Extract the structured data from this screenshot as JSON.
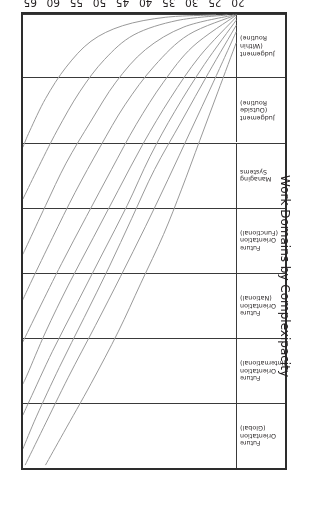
{
  "figure": {
    "orientation_note": "page-rotated-180",
    "frame_color": "#2d2d2d",
    "curve_color": "#9a9a9a",
    "background": "#ffffff"
  },
  "axes": {
    "x": {
      "title": "Age",
      "ticks": [
        20,
        25,
        30,
        35,
        40,
        45,
        50,
        55,
        60,
        65
      ],
      "min": 20,
      "max": 67
    },
    "y": {
      "title": "Work Domains by Complexipacity"
    }
  },
  "chart_data": {
    "type": "line",
    "title": "",
    "xlabel": "Age",
    "ylabel": "Work Domains by Complexipacity",
    "xlim": [
      20,
      67
    ],
    "grid": false,
    "legend": "none",
    "categories": [
      "Future\nOrientation\n(Global)",
      "Future\nOrientation\n(International)",
      "Future\nOrientation\n(National)",
      "Future\nOrientation\n(Functional)",
      "Managing\nSystems",
      "Judgement\n(Outside\nRoutine)",
      "Judgement\n(Within\nRoutine)"
    ],
    "band_boundaries_age_index": [
      0,
      1,
      2,
      3,
      4,
      5,
      6,
      7
    ],
    "series": [
      {
        "name": "track-1",
        "points": [
          [
            20.0,
            6.55
          ],
          [
            24.0,
            5.8
          ],
          [
            28.0,
            5.05
          ],
          [
            32.0,
            4.3
          ],
          [
            36.0,
            3.6
          ],
          [
            41.0,
            2.85
          ],
          [
            46.0,
            2.1
          ],
          [
            52.0,
            1.3
          ],
          [
            58.0,
            0.55
          ],
          [
            62.0,
            0.05
          ]
        ]
      },
      {
        "name": "track-2",
        "points": [
          [
            20.0,
            6.72
          ],
          [
            25.0,
            5.95
          ],
          [
            30.0,
            5.2
          ],
          [
            35.0,
            4.45
          ],
          [
            40.0,
            3.72
          ],
          [
            45.5,
            2.95
          ],
          [
            51.0,
            2.2
          ],
          [
            57.0,
            1.4
          ],
          [
            62.5,
            0.62
          ],
          [
            66.5,
            0.05
          ]
        ]
      },
      {
        "name": "track-3",
        "points": [
          [
            20.0,
            6.82
          ],
          [
            26.0,
            6.1
          ],
          [
            32.0,
            5.35
          ],
          [
            38.0,
            4.6
          ],
          [
            43.0,
            3.85
          ],
          [
            48.0,
            3.1
          ],
          [
            53.5,
            2.32
          ],
          [
            59.0,
            1.55
          ],
          [
            64.0,
            0.8
          ],
          [
            67.0,
            0.3
          ]
        ]
      },
      {
        "name": "track-4",
        "points": [
          [
            20.0,
            6.9
          ],
          [
            27.0,
            6.22
          ],
          [
            33.5,
            5.5
          ],
          [
            39.0,
            4.8
          ],
          [
            44.0,
            4.05
          ],
          [
            49.5,
            3.3
          ],
          [
            55.0,
            2.55
          ],
          [
            60.5,
            1.8
          ],
          [
            65.5,
            1.05
          ],
          [
            67.0,
            0.82
          ]
        ]
      },
      {
        "name": "track-5",
        "points": [
          [
            20.0,
            6.95
          ],
          [
            28.0,
            6.35
          ],
          [
            34.5,
            5.7
          ],
          [
            40.5,
            5.0
          ],
          [
            46.0,
            4.28
          ],
          [
            51.5,
            3.55
          ],
          [
            57.0,
            2.82
          ],
          [
            62.0,
            2.1
          ],
          [
            66.0,
            1.45
          ],
          [
            67.0,
            1.3
          ]
        ]
      },
      {
        "name": "track-6",
        "points": [
          [
            20.0,
            6.98
          ],
          [
            29.5,
            6.5
          ],
          [
            36.0,
            5.95
          ],
          [
            42.0,
            5.3
          ],
          [
            47.5,
            4.6
          ],
          [
            53.0,
            3.88
          ],
          [
            58.5,
            3.15
          ],
          [
            63.5,
            2.45
          ],
          [
            67.0,
            1.95
          ]
        ]
      },
      {
        "name": "track-7",
        "points": [
          [
            20.0,
            7.0
          ],
          [
            30.5,
            6.68
          ],
          [
            38.0,
            6.2
          ],
          [
            44.5,
            5.6
          ],
          [
            50.0,
            4.95
          ],
          [
            55.5,
            4.25
          ],
          [
            60.5,
            3.55
          ],
          [
            65.0,
            2.9
          ],
          [
            67.0,
            2.6
          ]
        ]
      },
      {
        "name": "track-8",
        "points": [
          [
            20.5,
            7.0
          ],
          [
            31.5,
            6.8
          ],
          [
            40.0,
            6.45
          ],
          [
            46.5,
            5.95
          ],
          [
            52.0,
            5.35
          ],
          [
            57.5,
            4.7
          ],
          [
            62.0,
            4.05
          ],
          [
            66.0,
            3.45
          ],
          [
            67.0,
            3.3
          ]
        ]
      },
      {
        "name": "track-9",
        "points": [
          [
            22.0,
            7.0
          ],
          [
            33.0,
            6.9
          ],
          [
            42.5,
            6.68
          ],
          [
            49.0,
            6.3
          ],
          [
            54.5,
            5.8
          ],
          [
            59.5,
            5.2
          ],
          [
            64.0,
            4.58
          ],
          [
            67.0,
            4.15
          ]
        ]
      },
      {
        "name": "track-10",
        "points": [
          [
            24.5,
            7.0
          ],
          [
            35.5,
            6.95
          ],
          [
            45.0,
            6.82
          ],
          [
            52.0,
            6.58
          ],
          [
            57.5,
            6.18
          ],
          [
            62.0,
            5.7
          ],
          [
            65.5,
            5.2
          ],
          [
            67.0,
            4.95
          ]
        ]
      }
    ]
  }
}
